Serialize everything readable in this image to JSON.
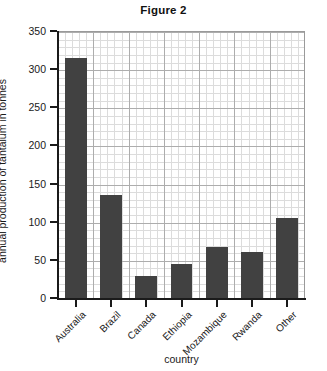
{
  "chart_data": {
    "type": "bar",
    "title": "Figure 2",
    "xlabel": "country",
    "ylabel": "annual production of tantalum in tonnes",
    "categories": [
      "Australia",
      "Brazil",
      "Canada",
      "Ethiopia",
      "Mozambique",
      "Rwanda",
      "Other"
    ],
    "values": [
      315,
      135,
      29,
      45,
      67,
      60,
      105
    ],
    "ylim": [
      0,
      350
    ],
    "yticks": [
      0,
      50,
      100,
      150,
      200,
      250,
      300,
      350
    ],
    "ytick_labels": [
      "0",
      "50",
      "100",
      "150",
      "200",
      "250",
      "300",
      "350"
    ],
    "grid": true,
    "minor_grid": true,
    "minor_ticks_per_major": 5,
    "legend": null,
    "bar_color": "#414141",
    "grid_color": "#adadad",
    "minor_grid_color": "#dcdcdc",
    "axis_color": "#1a1a1a",
    "background": "#ffffff",
    "xtick_label_rotation": -45
  }
}
